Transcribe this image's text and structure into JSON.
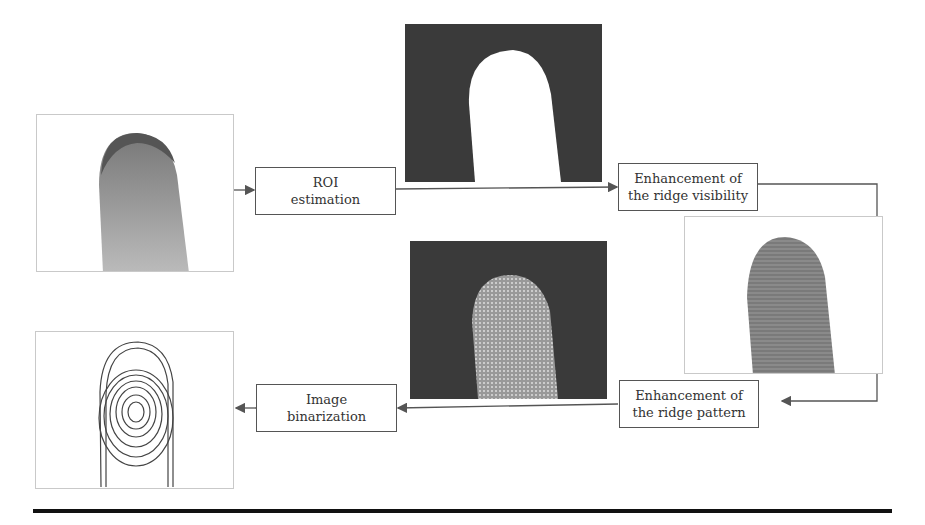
{
  "diagram": {
    "type": "fingerprint-processing-pipeline",
    "steps": [
      {
        "id": "roi",
        "label_line1": "ROI",
        "label_line2": "estimation"
      },
      {
        "id": "visibility",
        "label_line1": "Enhancement of",
        "label_line2": "the ridge visibility"
      },
      {
        "id": "pattern",
        "label_line1": "Enhancement of",
        "label_line2": "the ridge pattern"
      },
      {
        "id": "binarization",
        "label_line1": "Image",
        "label_line2": "binarization"
      }
    ],
    "images": [
      {
        "id": "input-finger",
        "description": "Grayscale fingertip photo on white background"
      },
      {
        "id": "roi-mask",
        "description": "White finger silhouette mask on dark background"
      },
      {
        "id": "visibility-result",
        "description": "Fingertip with enhanced ridge visibility on white background"
      },
      {
        "id": "pattern-result",
        "description": "Enhanced ridge pattern fingertip on dark background"
      },
      {
        "id": "binary-result",
        "description": "Binarized fingerprint ridge pattern"
      }
    ],
    "colors": {
      "box_border": "#555555",
      "arrow": "#555555",
      "dark_background": "#3a3a3a",
      "rule": "#111111"
    }
  }
}
